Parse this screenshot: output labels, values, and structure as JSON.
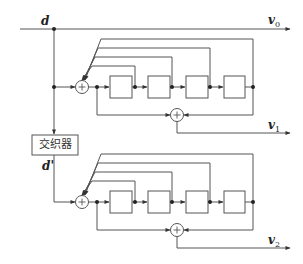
{
  "diagram": {
    "type": "turbo-encoder-block-diagram",
    "input_label": "d",
    "interleaved_label": "d'",
    "interleaver_label": "交织器",
    "outputs": [
      {
        "label": "v",
        "sub": "0"
      },
      {
        "label": "v",
        "sub": "1"
      },
      {
        "label": "v",
        "sub": "2"
      }
    ],
    "encoders": [
      {
        "name": "rsc-encoder-1",
        "registers": 4
      },
      {
        "name": "rsc-encoder-2",
        "registers": 4
      }
    ],
    "colors": {
      "line": "#555555",
      "background": "#ffffff"
    }
  }
}
